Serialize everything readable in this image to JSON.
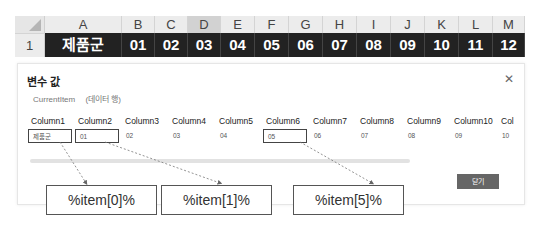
{
  "spreadsheet": {
    "column_headers": [
      "A",
      "B",
      "C",
      "D",
      "E",
      "F",
      "G",
      "H",
      "I",
      "J",
      "K",
      "L",
      "M"
    ],
    "selected_column": "D",
    "row_number": "1",
    "row_values": [
      "제품군",
      "01",
      "02",
      "03",
      "04",
      "05",
      "06",
      "07",
      "08",
      "09",
      "10",
      "11",
      "12"
    ],
    "colors": {
      "row_bg": "#222222",
      "row_text": "#ffffff",
      "header_bg": "#ececec",
      "selected_header_bg": "#d2d2d2"
    }
  },
  "dialog": {
    "title": "변수 값",
    "close_icon": "close-icon",
    "variable_name": "CurrentItem",
    "variable_type": "(데이터 행)",
    "columns": [
      {
        "header": "Column1",
        "value": "제품군",
        "highlighted": true
      },
      {
        "header": "Column2",
        "value": "01",
        "highlighted": true
      },
      {
        "header": "Column3",
        "value": "02",
        "highlighted": false
      },
      {
        "header": "Column4",
        "value": "03",
        "highlighted": false
      },
      {
        "header": "Column5",
        "value": "04",
        "highlighted": false
      },
      {
        "header": "Column6",
        "value": "05",
        "highlighted": true
      },
      {
        "header": "Column7",
        "value": "06",
        "highlighted": false
      },
      {
        "header": "Column8",
        "value": "07",
        "highlighted": false
      },
      {
        "header": "Column9",
        "value": "08",
        "highlighted": false
      },
      {
        "header": "Column10",
        "value": "09",
        "highlighted": false
      },
      {
        "header": "Col",
        "value": "10",
        "highlighted": false
      }
    ],
    "close_button_label": "닫기",
    "button_color": "#666666"
  },
  "callouts": [
    {
      "label": "%item[0]%"
    },
    {
      "label": "%item[1]%"
    },
    {
      "label": "%item[5]%"
    }
  ]
}
